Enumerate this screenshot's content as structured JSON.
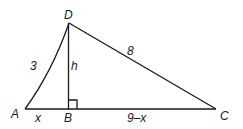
{
  "diagram": {
    "type": "triangle-with-altitude",
    "vertices": {
      "A": {
        "label": "A",
        "x": 25,
        "y": 109
      },
      "B": {
        "label": "B",
        "x": 68,
        "y": 109
      },
      "C": {
        "label": "C",
        "x": 216,
        "y": 109
      },
      "D": {
        "label": "D",
        "x": 69,
        "y": 23
      }
    },
    "side_labels": {
      "AD": "3",
      "DC": "8",
      "DB": "h",
      "AB": "x",
      "BC": "9–x"
    },
    "right_angle_at": "B",
    "stroke_color": "#1a1a1a"
  }
}
